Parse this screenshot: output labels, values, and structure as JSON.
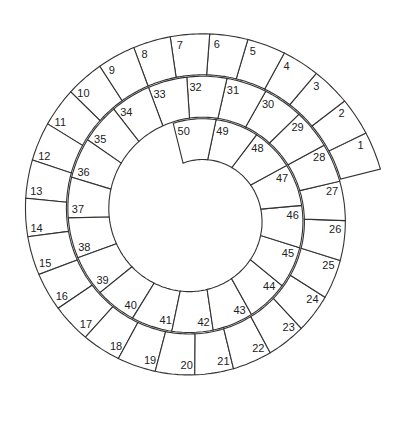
{
  "diagram": {
    "type": "spiral-track",
    "cell_count": 50,
    "cells": [
      {
        "n": 1
      },
      {
        "n": 2
      },
      {
        "n": 3
      },
      {
        "n": 4
      },
      {
        "n": 5
      },
      {
        "n": 6
      },
      {
        "n": 7
      },
      {
        "n": 8
      },
      {
        "n": 9
      },
      {
        "n": 10
      },
      {
        "n": 11
      },
      {
        "n": 12
      },
      {
        "n": 13
      },
      {
        "n": 14
      },
      {
        "n": 15
      },
      {
        "n": 16
      },
      {
        "n": 17
      },
      {
        "n": 18
      },
      {
        "n": 19
      },
      {
        "n": 20
      },
      {
        "n": 21
      },
      {
        "n": 22
      },
      {
        "n": 23
      },
      {
        "n": 24
      },
      {
        "n": 25
      },
      {
        "n": 26
      },
      {
        "n": 27
      },
      {
        "n": 28
      },
      {
        "n": 29
      },
      {
        "n": 30
      },
      {
        "n": 31
      },
      {
        "n": 32
      },
      {
        "n": 33
      },
      {
        "n": 34
      },
      {
        "n": 35
      },
      {
        "n": 36
      },
      {
        "n": 37
      },
      {
        "n": 38
      },
      {
        "n": 39
      },
      {
        "n": 40
      },
      {
        "n": 41
      },
      {
        "n": 42
      },
      {
        "n": 43
      },
      {
        "n": 44
      },
      {
        "n": 45
      },
      {
        "n": 46
      },
      {
        "n": 47
      },
      {
        "n": 48
      },
      {
        "n": 49
      },
      {
        "n": 50
      }
    ],
    "rings": [
      {
        "label": "outer turn",
        "from": 1,
        "to": 21
      },
      {
        "label": "middle turn",
        "from": 22,
        "to": 37
      },
      {
        "label": "inner turn",
        "from": 38,
        "to": 50
      }
    ],
    "geometry": {
      "center_x": 196,
      "center_y": 215,
      "start_angle_deg": 14,
      "outer_radius_start": 190,
      "shrink_per_degree": 0.118,
      "ring_width": 41,
      "turn_end_cells": [
        21,
        37,
        50
      ],
      "end_angle_deg": 810
    },
    "colors": {
      "stroke": "#333333",
      "fill": "#ffffff",
      "text": "#222222"
    }
  }
}
